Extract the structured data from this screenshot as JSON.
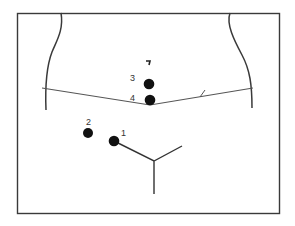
{
  "diagram": {
    "type": "trocar-port-placement",
    "colors": {
      "stroke": "#3a3a3a",
      "port": "#111111",
      "background": "#ffffff"
    },
    "ports": [
      {
        "id": "1",
        "label": "1",
        "cx": 114,
        "cy": 141,
        "label_x": 121,
        "label_y": 136
      },
      {
        "id": "2",
        "label": "2",
        "cx": 88,
        "cy": 133,
        "label_x": 86,
        "label_y": 125
      },
      {
        "id": "3",
        "label": "3",
        "cx": 149,
        "cy": 84,
        "label_x": 130,
        "label_y": 81
      },
      {
        "id": "4",
        "label": "4",
        "cx": 150,
        "cy": 100,
        "label_x": 130,
        "label_y": 100
      }
    ],
    "umbilicus_marker": {
      "x": 147,
      "y": 61
    }
  }
}
